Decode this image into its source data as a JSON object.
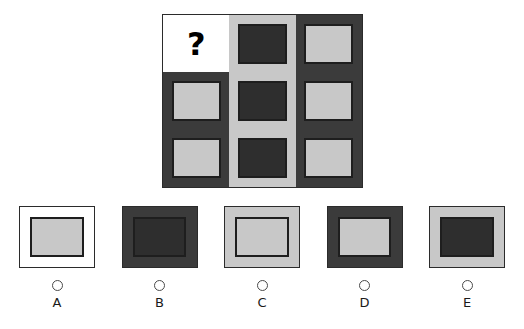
{
  "puzzle": {
    "type": "matrix-reasoning",
    "missing_cell_symbol": "?",
    "grid": {
      "rows": 3,
      "columns": 3,
      "cells": [
        {
          "position": "r1c1",
          "frame": "white",
          "inner": "none",
          "is_missing": true,
          "symbol": "?"
        },
        {
          "position": "r1c2",
          "frame": "light",
          "inner": "dark",
          "is_missing": false,
          "symbol": ""
        },
        {
          "position": "r1c3",
          "frame": "dark",
          "inner": "light",
          "is_missing": false,
          "symbol": ""
        },
        {
          "position": "r2c1",
          "frame": "dark",
          "inner": "light",
          "is_missing": false,
          "symbol": ""
        },
        {
          "position": "r2c2",
          "frame": "light",
          "inner": "dark",
          "is_missing": false,
          "symbol": ""
        },
        {
          "position": "r2c3",
          "frame": "dark",
          "inner": "light",
          "is_missing": false,
          "symbol": ""
        },
        {
          "position": "r3c1",
          "frame": "dark",
          "inner": "light",
          "is_missing": false,
          "symbol": ""
        },
        {
          "position": "r3c2",
          "frame": "light",
          "inner": "dark",
          "is_missing": false,
          "symbol": ""
        },
        {
          "position": "r3c3",
          "frame": "dark",
          "inner": "light",
          "is_missing": false,
          "symbol": ""
        }
      ]
    }
  },
  "options": [
    {
      "label": "A",
      "frame": "white",
      "inner": "light",
      "selected": false
    },
    {
      "label": "B",
      "frame": "dark",
      "inner": "dark",
      "selected": false
    },
    {
      "label": "C",
      "frame": "light",
      "inner": "light",
      "selected": false
    },
    {
      "label": "D",
      "frame": "dark",
      "inner": "light",
      "selected": false
    },
    {
      "label": "E",
      "frame": "light",
      "inner": "dark",
      "selected": false
    }
  ],
  "colors": {
    "dark_gray": "#3b3b3b",
    "inner_dark": "#2e2e2e",
    "light_gray": "#c8c8c8",
    "white": "#ffffff",
    "outline": "#1e1e1e",
    "label_text": "#1a1a1a",
    "radio_outline": "#4a4a4a",
    "page_background": "#ffffff"
  }
}
